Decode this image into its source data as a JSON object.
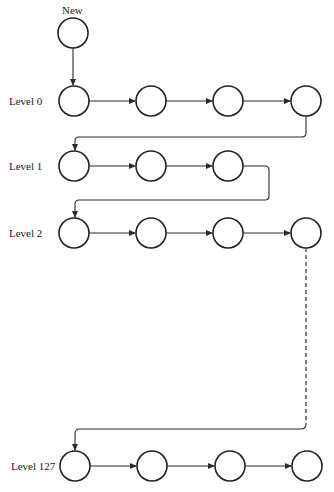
{
  "diagram": {
    "title": "",
    "new_node_label": "New",
    "levels": [
      {
        "label": "Level 0",
        "node_count": 4
      },
      {
        "label": "Level 1",
        "node_count": 3
      },
      {
        "label": "Level 2",
        "node_count": 4
      },
      {
        "label": "Level 127",
        "node_count": 4
      }
    ],
    "gap_indicator": "dashed-line between Level 2 and Level 127",
    "colors": {
      "stroke": "#222222",
      "background": "#ffffff"
    }
  }
}
